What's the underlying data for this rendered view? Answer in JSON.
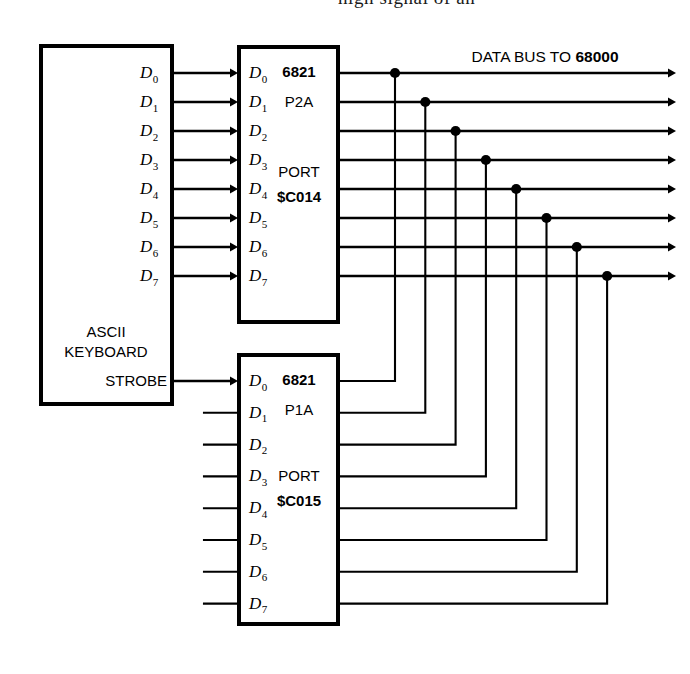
{
  "page": {
    "partial_text_top": "high signal of an",
    "background_color": "#ffffff",
    "line_color": "#000000"
  },
  "keyboard_box": {
    "name": "ASCII KEYBOARD",
    "line1": "ASCII",
    "line2": "KEYBOARD",
    "strobe_label": "STROBE",
    "output_pins": [
      "D0",
      "D1",
      "D2",
      "D3",
      "D4",
      "D5",
      "D6",
      "D7"
    ],
    "pin_letter": "D",
    "pin_subscripts": [
      "0",
      "1",
      "2",
      "3",
      "4",
      "5",
      "6",
      "7"
    ]
  },
  "pia_upper": {
    "chip": "6821",
    "port_name": "P2A",
    "port_word": "PORT",
    "address": "$C014",
    "pins": [
      {
        "letter": "D",
        "sub": "0"
      },
      {
        "letter": "D",
        "sub": "1"
      },
      {
        "letter": "D",
        "sub": "2"
      },
      {
        "letter": "D",
        "sub": "3"
      },
      {
        "letter": "D",
        "sub": "4"
      },
      {
        "letter": "D",
        "sub": "5"
      },
      {
        "letter": "D",
        "sub": "6"
      },
      {
        "letter": "D",
        "sub": "7"
      }
    ]
  },
  "pia_lower": {
    "chip": "6821",
    "port_name": "P1A",
    "port_word": "PORT",
    "address": "$C015",
    "pins": [
      {
        "letter": "D",
        "sub": "0"
      },
      {
        "letter": "D",
        "sub": "1"
      },
      {
        "letter": "D",
        "sub": "2"
      },
      {
        "letter": "D",
        "sub": "3"
      },
      {
        "letter": "D",
        "sub": "4"
      },
      {
        "letter": "D",
        "sub": "5"
      },
      {
        "letter": "D",
        "sub": "6"
      },
      {
        "letter": "D",
        "sub": "7"
      }
    ]
  },
  "data_bus": {
    "label_prefix": "DATA BUS TO ",
    "label_target": "68000",
    "line_count": 8
  }
}
